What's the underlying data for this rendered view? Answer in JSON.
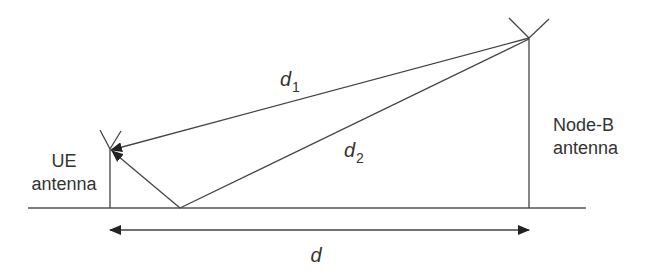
{
  "diagram": {
    "labels": {
      "ue_line1": "UE",
      "ue_line2": "antenna",
      "nodeb_line1": "Node-B",
      "nodeb_line2": "antenna",
      "d1_main": "d",
      "d1_sub": "1",
      "d2_main": "d",
      "d2_sub": "2",
      "d": "d"
    },
    "colors": {
      "line": "#444444",
      "text": "#333333",
      "background": "#ffffff"
    },
    "elements": [
      {
        "id": "ground",
        "type": "line"
      },
      {
        "id": "ue-antenna",
        "type": "antenna",
        "label": "UE antenna"
      },
      {
        "id": "nodeb-antenna",
        "type": "antenna",
        "label": "Node-B antenna"
      },
      {
        "id": "direct-path",
        "type": "arrow",
        "label": "d1"
      },
      {
        "id": "reflected-path",
        "type": "arrow",
        "label": "d2"
      },
      {
        "id": "horizontal-distance",
        "type": "double-arrow",
        "label": "d"
      }
    ]
  }
}
